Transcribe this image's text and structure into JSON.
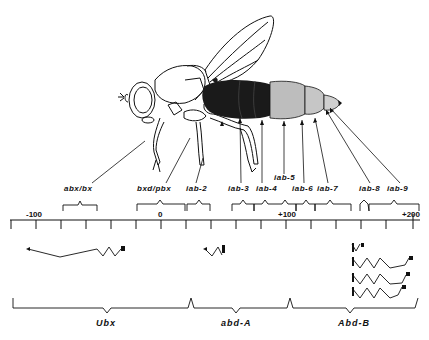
{
  "figure": {
    "regulatory_regions": [
      {
        "id": "abx_bx",
        "label": "abx/bx",
        "x": 80,
        "y": 188
      },
      {
        "id": "bxd_pbx",
        "label": "bxd/pbx",
        "x": 138,
        "y": 188
      },
      {
        "id": "iab2",
        "label": "iab-2",
        "x": 186,
        "y": 188
      },
      {
        "id": "iab3",
        "label": "iab-3",
        "x": 229,
        "y": 188
      },
      {
        "id": "iab4",
        "label": "iab-4",
        "x": 256,
        "y": 188
      },
      {
        "id": "iab5",
        "label": "iab-5",
        "x": 275,
        "y": 177
      },
      {
        "id": "iab6",
        "label": "iab-6",
        "x": 292,
        "y": 188
      },
      {
        "id": "iab7",
        "label": "iab-7",
        "x": 318,
        "y": 188
      },
      {
        "id": "iab8",
        "label": "iab-8",
        "x": 360,
        "y": 188
      },
      {
        "id": "iab9",
        "label": "iab-9",
        "x": 388,
        "y": 188
      }
    ],
    "scale": {
      "ticks": [
        {
          "label": "-100",
          "x": 30,
          "y": 204
        },
        {
          "label": "0",
          "x": 158,
          "y": 204
        },
        {
          "label": "+100",
          "x": 277,
          "y": 204
        },
        {
          "label": "+200",
          "x": 403,
          "y": 204
        }
      ]
    },
    "genes": [
      {
        "id": "ubx",
        "label": "Ubx",
        "x": 96,
        "y": 322
      },
      {
        "id": "abd_a",
        "label": "abd-A",
        "x": 222,
        "y": 322
      },
      {
        "id": "abd_b",
        "label": "Abd-B",
        "x": 337,
        "y": 322
      }
    ]
  }
}
